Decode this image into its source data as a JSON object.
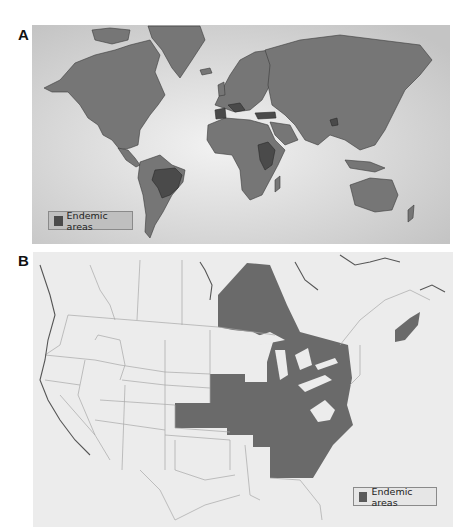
{
  "figure": {
    "panels": [
      {
        "label": "A",
        "title": "World map",
        "legend": {
          "label": "Endemic areas"
        },
        "colors": {
          "ocean": "#d9d9d9",
          "land": "#747474",
          "endemic": "#4a4a4a",
          "border": "#3a3a3a"
        },
        "endemic_regions": [
          "Brazil",
          "Paraguay",
          "Spain",
          "Mediterranean coast",
          "Turkey",
          "Sudan",
          "Ethiopia",
          "Kenya",
          "China (spots)"
        ]
      },
      {
        "label": "B",
        "title": "North America map",
        "legend": {
          "label": "Endemic areas"
        },
        "colors": {
          "background": "#ececec",
          "land": "#ececec",
          "endemic": "#6a6a6a",
          "border": "#a8a8a8"
        },
        "endemic_regions": [
          "Ontario",
          "Quebec (south)",
          "Nova Scotia",
          "Great Lakes states",
          "Ohio River Valley",
          "Mid-Atlantic states",
          "Southeastern states"
        ]
      }
    ]
  }
}
